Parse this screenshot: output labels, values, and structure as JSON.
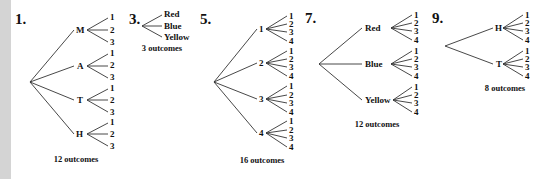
{
  "problems": [
    {
      "number": "1.",
      "root": [
        30,
        82
      ],
      "branches": [
        {
          "label": "M",
          "pos": [
            79,
            30
          ],
          "leaves": [
            "1",
            "2",
            "3"
          ],
          "leaf_y": [
            17,
            30,
            42
          ]
        },
        {
          "label": "A",
          "pos": [
            79,
            66
          ],
          "leaves": [
            "1",
            "2",
            "3"
          ],
          "leaf_y": [
            53,
            65,
            77
          ]
        },
        {
          "label": "T",
          "pos": [
            79,
            100
          ],
          "leaves": [
            "1",
            "2",
            "3"
          ],
          "leaf_y": [
            88,
            100,
            112
          ]
        },
        {
          "label": "H",
          "pos": [
            79,
            134
          ],
          "leaves": [
            "1",
            "2",
            "3"
          ],
          "leaf_y": [
            122,
            134,
            146
          ]
        }
      ],
      "outcomes": "12 outcomes"
    },
    {
      "number": "3.",
      "root": [
        142,
        26
      ],
      "leaves": [
        "Red",
        "Blue",
        "Yellow"
      ],
      "outcomes": "3 outcomes"
    },
    {
      "number": "5.",
      "root": [
        214,
        82
      ],
      "branches": [
        {
          "label": "1",
          "pos": [
            261,
            29
          ],
          "leaves": [
            "1",
            "2",
            "3",
            "4"
          ],
          "leaf_y": [
            16,
            24,
            32,
            41
          ]
        },
        {
          "label": "2",
          "pos": [
            261,
            63
          ],
          "leaves": [
            "1",
            "2",
            "3",
            "4"
          ],
          "leaf_y": [
            51,
            59,
            67,
            76
          ]
        },
        {
          "label": "3",
          "pos": [
            261,
            99
          ],
          "leaves": [
            "1",
            "2",
            "3",
            "4"
          ],
          "leaf_y": [
            86,
            95,
            103,
            112
          ]
        },
        {
          "label": "4",
          "pos": [
            261,
            133
          ],
          "leaves": [
            "1",
            "2",
            "3",
            "4"
          ],
          "leaf_y": [
            121,
            130,
            138,
            147
          ]
        }
      ],
      "outcomes": "16 outcomes"
    },
    {
      "number": "7.",
      "root": [
        319,
        64
      ],
      "branches": [
        {
          "label": "Red",
          "pos": [
            365,
            28
          ],
          "leaves": [
            "1",
            "2",
            "3",
            "4"
          ],
          "leaf_y": [
            15,
            23,
            31,
            40
          ]
        },
        {
          "label": "Blue",
          "pos": [
            365,
            64
          ],
          "leaves": [
            "1",
            "2",
            "3",
            "4"
          ],
          "leaf_y": [
            51,
            59,
            67,
            76
          ]
        },
        {
          "label": "Yellow",
          "pos": [
            365,
            100
          ],
          "leaves": [
            "1",
            "2",
            "3",
            "4"
          ],
          "leaf_y": [
            87,
            95,
            103,
            112
          ]
        }
      ],
      "outcomes": "12 outcomes"
    },
    {
      "number": "9.",
      "root": [
        445,
        46
      ],
      "branches": [
        {
          "label": "H",
          "pos": [
            497,
            28
          ],
          "leaves": [
            "1",
            "2",
            "3",
            "4"
          ],
          "leaf_y": [
            15,
            23,
            31,
            40
          ]
        },
        {
          "label": "T",
          "pos": [
            497,
            64
          ],
          "leaves": [
            "1",
            "2",
            "3",
            "4"
          ],
          "leaf_y": [
            51,
            59,
            67,
            76
          ]
        }
      ],
      "outcomes": "8 outcomes"
    }
  ]
}
